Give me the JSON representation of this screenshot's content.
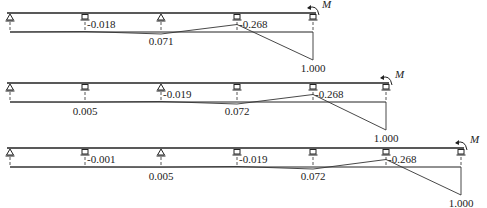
{
  "diagrams": [
    {
      "name": "beam-3-span",
      "moment_label": "M",
      "beam_y": 13,
      "baseline_y": 32,
      "supports": [
        {
          "x": 10,
          "type": "pin"
        },
        {
          "x": 85,
          "type": "roller"
        },
        {
          "x": 161,
          "type": "pin"
        },
        {
          "x": 237,
          "type": "roller"
        },
        {
          "x": 313,
          "type": "roller"
        }
      ],
      "values": [
        {
          "support_index": 1,
          "text": "-0.018",
          "value": -0.018
        },
        {
          "support_index": 2,
          "text": "0.071",
          "value": 0.071
        },
        {
          "support_index": 3,
          "text": "-0.268",
          "value": -0.268
        },
        {
          "support_index": 4,
          "text": "1.000",
          "value": 1.0
        }
      ]
    },
    {
      "name": "beam-4-span",
      "moment_label": "M",
      "beam_y": 83,
      "baseline_y": 102,
      "supports": [
        {
          "x": 10,
          "type": "pin"
        },
        {
          "x": 85,
          "type": "roller"
        },
        {
          "x": 161,
          "type": "pin"
        },
        {
          "x": 237,
          "type": "roller"
        },
        {
          "x": 313,
          "type": "roller"
        },
        {
          "x": 386,
          "type": "roller"
        }
      ],
      "values": [
        {
          "support_index": 1,
          "text": "0.005",
          "value": 0.005
        },
        {
          "support_index": 2,
          "text": "-0.019",
          "value": -0.019
        },
        {
          "support_index": 3,
          "text": "0.072",
          "value": 0.072
        },
        {
          "support_index": 4,
          "text": "-0.268",
          "value": -0.268
        },
        {
          "support_index": 5,
          "text": "1.000",
          "value": 1.0
        }
      ]
    },
    {
      "name": "beam-5-span",
      "moment_label": "M",
      "beam_y": 148,
      "baseline_y": 167,
      "supports": [
        {
          "x": 10,
          "type": "pin"
        },
        {
          "x": 85,
          "type": "roller"
        },
        {
          "x": 161,
          "type": "pin"
        },
        {
          "x": 237,
          "type": "roller"
        },
        {
          "x": 313,
          "type": "roller"
        },
        {
          "x": 386,
          "type": "roller"
        },
        {
          "x": 461,
          "type": "roller"
        }
      ],
      "values": [
        {
          "support_index": 1,
          "text": "-0.001",
          "value": -0.001
        },
        {
          "support_index": 2,
          "text": "0.005",
          "value": 0.005
        },
        {
          "support_index": 3,
          "text": "-0.019",
          "value": -0.019
        },
        {
          "support_index": 4,
          "text": "0.072",
          "value": 0.072
        },
        {
          "support_index": 5,
          "text": "-0.268",
          "value": -0.268
        },
        {
          "support_index": 6,
          "text": "1.000",
          "value": 1.0
        }
      ]
    }
  ]
}
